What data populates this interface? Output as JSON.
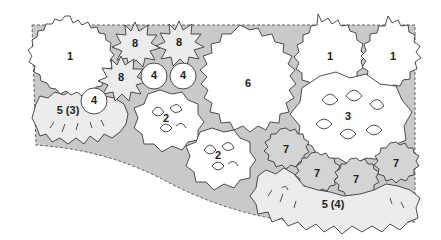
{
  "diagram": {
    "type": "planting-plan",
    "colors": {
      "bed_fill": "#c9c9c9",
      "plant_white": "#ffffff",
      "plant_light": "#ececec",
      "plant_mid": "#d4d4d4",
      "outline": "#3a3a3a",
      "label": "#1e1e1e"
    },
    "plants": [
      {
        "id": "p1a",
        "label": "1",
        "shape": "spiky-round",
        "x": 70,
        "y": 57
      },
      {
        "id": "p1b",
        "label": "1",
        "shape": "spiky-round",
        "x": 330,
        "y": 57
      },
      {
        "id": "p1c",
        "label": "1",
        "shape": "spiky-round",
        "x": 393,
        "y": 57
      },
      {
        "id": "p2a",
        "label": "2",
        "shape": "lobed-leaves",
        "x": 166,
        "y": 119
      },
      {
        "id": "p2b",
        "label": "2",
        "shape": "lobed-leaves",
        "x": 218,
        "y": 156
      },
      {
        "id": "p3",
        "label": "3",
        "shape": "lobed-leaves",
        "x": 348,
        "y": 117
      },
      {
        "id": "p4a",
        "label": "4",
        "shape": "circle",
        "x": 154,
        "y": 76
      },
      {
        "id": "p4b",
        "label": "4",
        "shape": "circle",
        "x": 183,
        "y": 76
      },
      {
        "id": "p4c",
        "label": "4",
        "shape": "circle",
        "x": 94,
        "y": 101
      },
      {
        "id": "p5a",
        "label": "5 (3)",
        "shape": "fringed-clump",
        "x": 68,
        "y": 111
      },
      {
        "id": "p5b",
        "label": "5 (4)",
        "shape": "fringed-clump",
        "x": 333,
        "y": 205
      },
      {
        "id": "p6",
        "label": "6",
        "shape": "jagged-large",
        "x": 248,
        "y": 84
      },
      {
        "id": "p7a",
        "label": "7",
        "shape": "serrated-round",
        "x": 286,
        "y": 150
      },
      {
        "id": "p7b",
        "label": "7",
        "shape": "serrated-round",
        "x": 317,
        "y": 174
      },
      {
        "id": "p7c",
        "label": "7",
        "shape": "serrated-round",
        "x": 356,
        "y": 180
      },
      {
        "id": "p7d",
        "label": "7",
        "shape": "serrated-round",
        "x": 396,
        "y": 164
      },
      {
        "id": "p8a",
        "label": "8",
        "shape": "star-burst",
        "x": 135,
        "y": 44
      },
      {
        "id": "p8b",
        "label": "8",
        "shape": "star-burst",
        "x": 179,
        "y": 43
      },
      {
        "id": "p8c",
        "label": "8",
        "shape": "star-burst",
        "x": 121,
        "y": 78
      }
    ]
  }
}
